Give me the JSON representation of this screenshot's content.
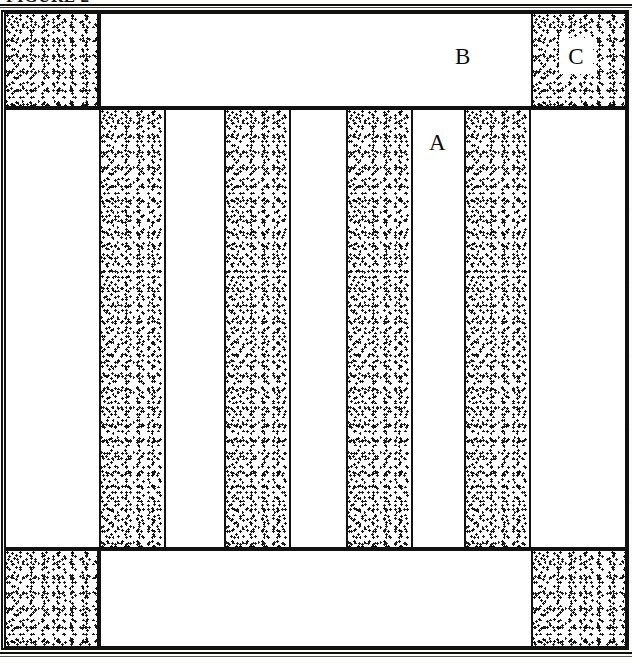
{
  "figure": {
    "caption": "FIGURE 2",
    "caption_clipped": true,
    "width": 632,
    "height": 663,
    "kind": "cross-section schematic"
  },
  "colors": {
    "ink": "#111111",
    "paper": "#ffffff",
    "page": "#fdfdfb",
    "stipple": "#1a1a1a"
  },
  "labels": [
    {
      "id": "a",
      "text": "A",
      "region": "white vertical stripe, middle band",
      "x": 429,
      "y": 131
    },
    {
      "id": "b",
      "text": "B",
      "region": "white block, top band",
      "x": 455,
      "y": 44
    },
    {
      "id": "c",
      "text": "C",
      "region": "white box over stippled block, top right",
      "x": 568,
      "y": 45
    }
  ],
  "bands": {
    "top": {
      "name": "top-band",
      "blocks": [
        {
          "id": "top-left-stipple",
          "fill": "stipple",
          "x": 3,
          "y": 2,
          "w": 95,
          "h": 96
        },
        {
          "id": "top-center-white",
          "fill": "white",
          "x": 98,
          "y": 2,
          "w": 432,
          "h": 96
        },
        {
          "id": "top-right-stipple",
          "fill": "stipple",
          "x": 530,
          "y": 2,
          "w": 93,
          "h": 96
        }
      ]
    },
    "middle": {
      "name": "middle-band",
      "note": "alternating white and stippled vertical stripes",
      "stripes": [
        {
          "id": "mid-stripe-1",
          "fill": "white",
          "x": 3,
          "w": 95
        },
        {
          "id": "mid-stripe-2",
          "fill": "stipple",
          "x": 98,
          "w": 65
        },
        {
          "id": "mid-stripe-3",
          "fill": "white",
          "x": 163,
          "w": 60
        },
        {
          "id": "mid-stripe-4",
          "fill": "stipple",
          "x": 223,
          "w": 65
        },
        {
          "id": "mid-stripe-5",
          "fill": "white",
          "x": 288,
          "w": 57
        },
        {
          "id": "mid-stripe-6",
          "fill": "stipple",
          "x": 345,
          "w": 65
        },
        {
          "id": "mid-stripe-7",
          "fill": "white",
          "x": 410,
          "w": 53
        },
        {
          "id": "mid-stripe-8",
          "fill": "stipple",
          "x": 463,
          "w": 65
        },
        {
          "id": "mid-stripe-9",
          "fill": "white",
          "x": 528,
          "w": 95
        }
      ],
      "y": 103,
      "h": 435
    },
    "bottom": {
      "name": "bottom-band",
      "blocks": [
        {
          "id": "bot-left-stipple",
          "fill": "stipple",
          "x": 3,
          "y": 543,
          "w": 95,
          "h": 93
        },
        {
          "id": "bot-center-white",
          "fill": "white",
          "x": 98,
          "y": 543,
          "w": 432,
          "h": 93
        },
        {
          "id": "bot-right-stipple",
          "fill": "stipple",
          "x": 530,
          "y": 543,
          "w": 93,
          "h": 93
        }
      ]
    }
  },
  "label_box_c": {
    "x": 556,
    "y": 28,
    "w": 34,
    "h": 36
  }
}
